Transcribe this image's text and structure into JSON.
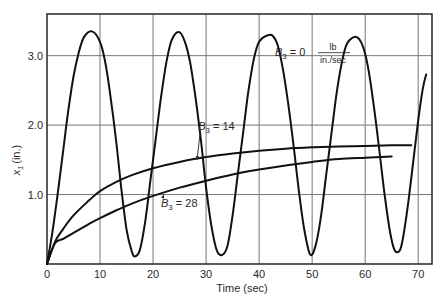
{
  "chart_data": {
    "type": "line",
    "title": "",
    "xlabel": "Time (sec)",
    "ylabel": "x1 (in.)",
    "ylabel_main": "x",
    "ylabel_sub": "1",
    "ylabel_unit": "(in.)",
    "xlim": [
      0,
      72.6
    ],
    "ylim": [
      0,
      3.6
    ],
    "grid": true,
    "x_ticks": [
      0,
      10,
      20,
      30,
      40,
      50,
      60,
      70
    ],
    "x_tick_labels": [
      "0",
      "10",
      "20",
      "30",
      "40",
      "50",
      "60",
      "70"
    ],
    "y_ticks": [
      1.0,
      2.0,
      3.0
    ],
    "y_tick_labels": [
      "1.0",
      "2.0",
      "3.0"
    ],
    "series": [
      {
        "name": "B3 = 0 lb/(in./sec)",
        "points": [
          [
            0,
            0
          ],
          [
            1,
            0.45
          ],
          [
            2,
            1.0
          ],
          [
            3,
            1.6
          ],
          [
            4,
            2.2
          ],
          [
            5,
            2.7
          ],
          [
            6,
            3.05
          ],
          [
            7,
            3.27
          ],
          [
            8.5,
            3.35
          ],
          [
            10,
            3.2
          ],
          [
            11,
            2.9
          ],
          [
            12,
            2.4
          ],
          [
            13,
            1.8
          ],
          [
            14,
            1.1
          ],
          [
            15,
            0.5
          ],
          [
            16,
            0.18
          ],
          [
            16.6,
            0.11
          ],
          [
            17.5,
            0.2
          ],
          [
            18.5,
            0.6
          ],
          [
            19.5,
            1.2
          ],
          [
            20.5,
            1.8
          ],
          [
            21.5,
            2.4
          ],
          [
            22.5,
            2.9
          ],
          [
            23.5,
            3.22
          ],
          [
            24.9,
            3.34
          ],
          [
            26,
            3.2
          ],
          [
            27,
            2.9
          ],
          [
            28,
            2.4
          ],
          [
            29,
            1.8
          ],
          [
            30,
            1.1
          ],
          [
            31,
            0.55
          ],
          [
            32,
            0.2
          ],
          [
            33,
            0.13
          ],
          [
            34,
            0.25
          ],
          [
            35,
            0.7
          ],
          [
            36,
            1.3
          ],
          [
            37,
            1.9
          ],
          [
            38,
            2.5
          ],
          [
            39,
            2.95
          ],
          [
            40,
            3.2
          ],
          [
            41.5,
            3.29
          ],
          [
            42.5,
            3.29
          ],
          [
            43.5,
            3.15
          ],
          [
            44.5,
            2.8
          ],
          [
            45.5,
            2.3
          ],
          [
            46.5,
            1.7
          ],
          [
            47.5,
            1.05
          ],
          [
            48.5,
            0.5
          ],
          [
            49.6,
            0.14
          ],
          [
            50.6,
            0.25
          ],
          [
            51.6,
            0.65
          ],
          [
            52.6,
            1.25
          ],
          [
            53.6,
            1.85
          ],
          [
            54.6,
            2.45
          ],
          [
            55.6,
            2.9
          ],
          [
            56.6,
            3.18
          ],
          [
            58.3,
            3.27
          ],
          [
            59.5,
            3.15
          ],
          [
            60.5,
            2.85
          ],
          [
            61.5,
            2.35
          ],
          [
            62.5,
            1.75
          ],
          [
            63.5,
            1.1
          ],
          [
            64.5,
            0.55
          ],
          [
            65.3,
            0.25
          ],
          [
            66,
            0.17
          ],
          [
            66.8,
            0.25
          ],
          [
            67.8,
            0.7
          ],
          [
            68.8,
            1.3
          ],
          [
            69.8,
            1.95
          ],
          [
            70.8,
            2.5
          ],
          [
            71.5,
            2.73
          ]
        ]
      },
      {
        "name": "B3 = 14",
        "points": [
          [
            0,
            0
          ],
          [
            1.5,
            0.32
          ],
          [
            3,
            0.5
          ],
          [
            5,
            0.7
          ],
          [
            8,
            0.92
          ],
          [
            10,
            1.05
          ],
          [
            13,
            1.18
          ],
          [
            16,
            1.28
          ],
          [
            20,
            1.38
          ],
          [
            25,
            1.47
          ],
          [
            30,
            1.54
          ],
          [
            35,
            1.59
          ],
          [
            40,
            1.63
          ],
          [
            45,
            1.66
          ],
          [
            50,
            1.68
          ],
          [
            55,
            1.69
          ],
          [
            60,
            1.7
          ],
          [
            65,
            1.71
          ],
          [
            68.7,
            1.71
          ]
        ]
      },
      {
        "name": "B3 = 28",
        "points": [
          [
            0,
            0
          ],
          [
            1.5,
            0.3
          ],
          [
            3,
            0.36
          ],
          [
            5,
            0.45
          ],
          [
            8,
            0.58
          ],
          [
            10,
            0.66
          ],
          [
            13,
            0.77
          ],
          [
            16,
            0.87
          ],
          [
            20,
            0.98
          ],
          [
            25,
            1.1
          ],
          [
            30,
            1.2
          ],
          [
            35,
            1.29
          ],
          [
            40,
            1.36
          ],
          [
            45,
            1.42
          ],
          [
            50,
            1.47
          ],
          [
            55,
            1.51
          ],
          [
            60,
            1.53
          ],
          [
            65,
            1.55
          ]
        ]
      }
    ],
    "annotations": [
      {
        "text_main": "B",
        "text_sub": "3",
        "text_rest": " = 0",
        "unit_num": "lb",
        "unit_den": "in./sec",
        "x": 43,
        "y": 3.0
      },
      {
        "text_main": "B",
        "text_sub": "3",
        "text_rest": " = 14",
        "x": 28.5,
        "y": 1.93,
        "arrow_to": [
          28.3,
          1.5
        ]
      },
      {
        "text_main": "B",
        "text_sub": "3",
        "text_rest": " = 28",
        "x": 21.5,
        "y": 0.82,
        "arrow_to": [
          22,
          1.0
        ]
      }
    ]
  }
}
